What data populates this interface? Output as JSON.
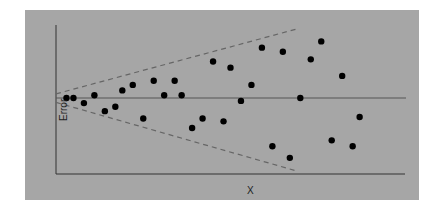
{
  "chart_data": {
    "type": "scatter",
    "title": "",
    "xlabel": "X",
    "ylabel": "Error",
    "grid": false,
    "legend": null,
    "background_color": "#a6a6a6",
    "point_color": "#000000",
    "axis_color": "#333333",
    "reference_line": {
      "type": "horizontal",
      "y": 0,
      "color": "#555555"
    },
    "envelope": {
      "style": "dashed",
      "color": "#666666",
      "upper": [
        [
          0,
          0.06
        ],
        [
          0.69,
          1.0
        ]
      ],
      "lower": [
        [
          0,
          -0.06
        ],
        [
          0.69,
          -1.0
        ]
      ]
    },
    "xlim": [
      0,
      1
    ],
    "ylim": [
      -1.05,
      1.0
    ],
    "points": [
      {
        "x": 0.03,
        "y": 0.0
      },
      {
        "x": 0.05,
        "y": 0.0
      },
      {
        "x": 0.08,
        "y": -0.07
      },
      {
        "x": 0.11,
        "y": 0.04
      },
      {
        "x": 0.14,
        "y": -0.18
      },
      {
        "x": 0.17,
        "y": -0.12
      },
      {
        "x": 0.19,
        "y": 0.11
      },
      {
        "x": 0.22,
        "y": 0.19
      },
      {
        "x": 0.25,
        "y": -0.28
      },
      {
        "x": 0.28,
        "y": 0.25
      },
      {
        "x": 0.31,
        "y": 0.04
      },
      {
        "x": 0.34,
        "y": 0.25
      },
      {
        "x": 0.36,
        "y": 0.04
      },
      {
        "x": 0.39,
        "y": -0.41
      },
      {
        "x": 0.42,
        "y": -0.28
      },
      {
        "x": 0.45,
        "y": 0.53
      },
      {
        "x": 0.48,
        "y": -0.32
      },
      {
        "x": 0.5,
        "y": 0.44
      },
      {
        "x": 0.53,
        "y": -0.04
      },
      {
        "x": 0.56,
        "y": 0.19
      },
      {
        "x": 0.59,
        "y": 0.73
      },
      {
        "x": 0.62,
        "y": -0.66
      },
      {
        "x": 0.65,
        "y": 0.67
      },
      {
        "x": 0.67,
        "y": -0.82
      },
      {
        "x": 0.7,
        "y": 0.0
      },
      {
        "x": 0.73,
        "y": 0.56
      },
      {
        "x": 0.76,
        "y": 0.82
      },
      {
        "x": 0.79,
        "y": -0.58
      },
      {
        "x": 0.82,
        "y": 0.32
      },
      {
        "x": 0.85,
        "y": -0.66
      },
      {
        "x": 0.87,
        "y": -0.26
      }
    ]
  },
  "labels": {
    "x_axis": "X",
    "y_axis": "Error"
  }
}
